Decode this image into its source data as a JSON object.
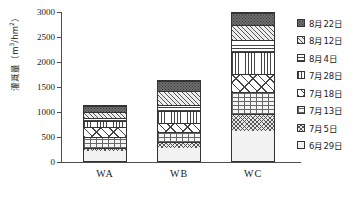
{
  "chart_data": {
    "type": "bar",
    "stacked": true,
    "title": "",
    "xlabel": "",
    "ylabel": "灌溉量（m3/hm2）",
    "ylabel_plain": "灌溉量（m³/hm²）",
    "categories": [
      "WA",
      "WB",
      "WC"
    ],
    "ylim": [
      0,
      3000
    ],
    "yticks": [
      "0",
      "500",
      "1000",
      "1500",
      "2000",
      "2500",
      "3000"
    ],
    "ytick_values": [
      0,
      500,
      1000,
      1500,
      2000,
      2500,
      3000
    ],
    "grid": false,
    "legend_position": "right",
    "series": [
      {
        "name": "6月29日",
        "key": "p-6-29",
        "values": [
          200,
          260,
          660
        ]
      },
      {
        "name": "7月5日",
        "key": "p-7-5",
        "values": [
          80,
          140,
          380
        ]
      },
      {
        "name": "7月13日",
        "key": "p-7-13",
        "values": [
          210,
          190,
          490
        ]
      },
      {
        "name": "7月18日",
        "key": "p-7-18",
        "values": [
          210,
          190,
          410
        ]
      },
      {
        "name": "7月28日",
        "key": "p-7-28",
        "values": [
          120,
          240,
          470
        ]
      },
      {
        "name": "8月4日",
        "key": "p-8-4",
        "values": [
          70,
          120,
          270
        ]
      },
      {
        "name": "8月12日",
        "key": "p-8-12",
        "values": [
          130,
          290,
          330
        ]
      },
      {
        "name": "8月22日",
        "key": "p-8-22",
        "values": [
          120,
          210,
          270
        ]
      }
    ],
    "totals": [
      1140,
      1640,
      3000
    ]
  },
  "legend": {
    "items": [
      {
        "label": "8月22日",
        "key": "p-8-22"
      },
      {
        "label": "8月12日",
        "key": "p-8-12"
      },
      {
        "label": "8月4日",
        "key": "p-8-4"
      },
      {
        "label": "7月28日",
        "key": "p-7-28"
      },
      {
        "label": "7月18日",
        "key": "p-7-18"
      },
      {
        "label": "7月13日",
        "key": "p-7-13"
      },
      {
        "label": "7月5日",
        "key": "p-7-5"
      },
      {
        "label": "6月29日",
        "key": "p-6-29"
      }
    ]
  }
}
